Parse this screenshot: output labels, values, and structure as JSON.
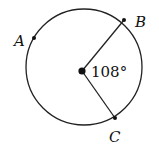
{
  "diagram": {
    "type": "circle-central-angle",
    "circle": {
      "cx": 84,
      "cy": 67,
      "r": 58,
      "stroke": "#222222"
    },
    "center": {
      "x": 82,
      "y": 71
    },
    "points": [
      {
        "name": "A",
        "label": "A",
        "x": 34,
        "y": 38,
        "label_x": 14,
        "label_y": 46
      },
      {
        "name": "B",
        "label": "B",
        "x": 124,
        "y": 20,
        "label_x": 135,
        "label_y": 27
      },
      {
        "name": "C",
        "label": "C",
        "x": 115,
        "y": 118,
        "label_x": 109,
        "label_y": 142
      }
    ],
    "angle_label": "108°",
    "angle_label_pos": {
      "x": 91,
      "y": 77
    }
  }
}
